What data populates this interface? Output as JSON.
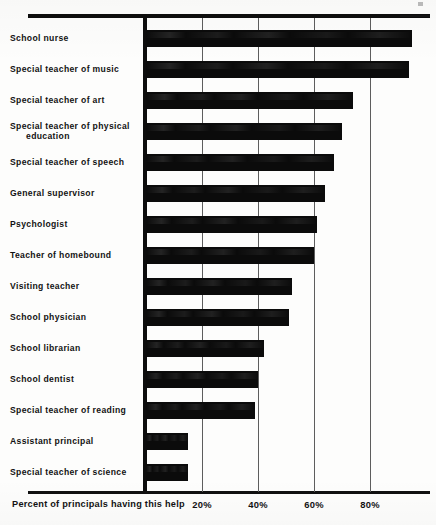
{
  "chart_data": {
    "type": "bar",
    "orientation": "horizontal",
    "title": "",
    "xlabel": "Percent of principals having this help",
    "ylabel": "",
    "xlim": [
      0,
      100
    ],
    "grid": true,
    "legend": "none",
    "xticks": [
      20,
      40,
      60,
      80
    ],
    "xtick_labels": [
      "20%",
      "40%",
      "60%",
      "80%"
    ],
    "categories": [
      "School nurse",
      "Special teacher of music",
      "Special teacher of art",
      "Special teacher of physical education",
      "Special teacher of speech",
      "General supervisor",
      "Psychologist",
      "Teacher of homebound",
      "Visiting teacher",
      "School physician",
      "School librarian",
      "School dentist",
      "Special teacher of reading",
      "Assistant principal",
      "Special teacher of science"
    ],
    "values": [
      95,
      94,
      74,
      70,
      67,
      64,
      61,
      60,
      52,
      51,
      42,
      40,
      39,
      15,
      15
    ],
    "series": [
      {
        "name": "Percent of principals having this help",
        "values": [
          95,
          94,
          74,
          70,
          67,
          64,
          61,
          60,
          52,
          51,
          42,
          40,
          39,
          15,
          15
        ]
      }
    ],
    "bar_color": "#0b0b0b",
    "background_color": "#fdfdfc"
  },
  "labels": {
    "rows": [
      {
        "line1": "School nurse",
        "line2": ""
      },
      {
        "line1": "Special teacher of music",
        "line2": ""
      },
      {
        "line1": "Special teacher of art",
        "line2": ""
      },
      {
        "line1": "Special teacher of physical",
        "line2": "education"
      },
      {
        "line1": "Special teacher of speech",
        "line2": ""
      },
      {
        "line1": "General supervisor",
        "line2": ""
      },
      {
        "line1": "Psychologist",
        "line2": ""
      },
      {
        "line1": "Teacher of homebound",
        "line2": ""
      },
      {
        "line1": "Visiting teacher",
        "line2": ""
      },
      {
        "line1": "School physician",
        "line2": ""
      },
      {
        "line1": "School librarian",
        "line2": ""
      },
      {
        "line1": "School dentist",
        "line2": ""
      },
      {
        "line1": "Special teacher of reading",
        "line2": ""
      },
      {
        "line1": "Assistant principal",
        "line2": ""
      },
      {
        "line1": "Special teacher of science",
        "line2": ""
      }
    ]
  },
  "axis": {
    "x_title": "Percent of principals having this help",
    "ticks": [
      "20%",
      "40%",
      "60%",
      "80%"
    ]
  }
}
